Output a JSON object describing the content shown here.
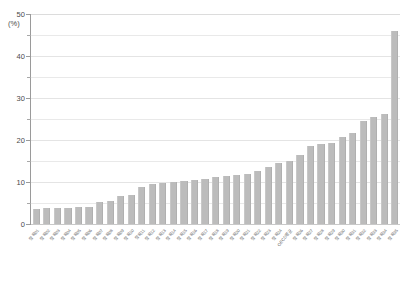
{
  "chart_data": {
    "type": "bar",
    "title": "",
    "subtitle": "",
    "xlabel": "",
    "ylabel": "",
    "unit_label": "(%)",
    "ylim": [
      0,
      50
    ],
    "ytick_labels": [
      "0",
      "10",
      "20",
      "30",
      "40",
      "50"
    ],
    "ytick_values": [
      0,
      10,
      20,
      30,
      40,
      50
    ],
    "minor_tick_values": [
      5,
      15,
      25,
      35,
      45
    ],
    "gridline_values": [
      5,
      10,
      15,
      20,
      25,
      30,
      35,
      40,
      45,
      50
    ],
    "grid": true,
    "legend": "none",
    "bar_color": "#bcbcbc",
    "sorted": "ascending",
    "categories": [
      "항목01",
      "항목02",
      "항목03",
      "항목04",
      "항목05",
      "항목06",
      "항목07",
      "항목08",
      "항목09",
      "항목10",
      "항목11",
      "항목12",
      "항목13",
      "항목14",
      "항목15",
      "항목16",
      "항목17",
      "항목18",
      "항목19",
      "항목20",
      "항목21",
      "항목22",
      "항목23",
      "항목24",
      "OECD평균",
      "항목26",
      "항목27",
      "항목28",
      "항목29",
      "항목30",
      "항목31",
      "항목32",
      "항목33",
      "항목34",
      "항목35"
    ],
    "values": [
      3.6,
      3.7,
      3.8,
      3.9,
      4.0,
      4.1,
      5.2,
      5.4,
      6.6,
      6.8,
      8.8,
      9.6,
      9.8,
      10.0,
      10.2,
      10.4,
      10.6,
      11.2,
      11.4,
      11.6,
      11.8,
      12.6,
      13.6,
      14.6,
      15.0,
      16.4,
      18.6,
      19.0,
      19.2,
      20.8,
      21.6,
      24.6,
      25.4,
      26.2,
      46.0
    ]
  }
}
